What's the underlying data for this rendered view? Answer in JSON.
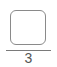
{
  "fraction": {
    "numerator": "",
    "denominator": "3"
  }
}
